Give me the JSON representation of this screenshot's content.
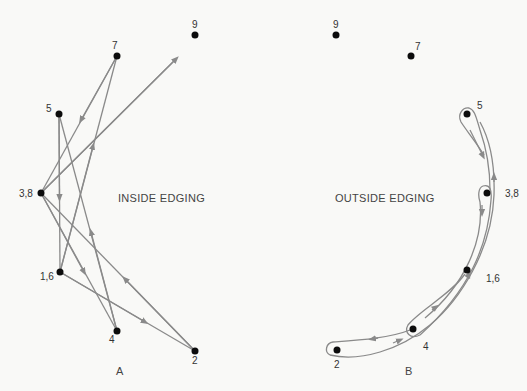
{
  "diagram_a": {
    "title": "INSIDE EDGING",
    "caption": "A",
    "points": [
      {
        "label": "9",
        "x": 195,
        "y": 35
      },
      {
        "label": "7",
        "x": 117,
        "y": 56
      },
      {
        "label": "5",
        "x": 59,
        "y": 114
      },
      {
        "label": "3,8",
        "x": 41,
        "y": 193
      },
      {
        "label": "1,6",
        "x": 60,
        "y": 272
      },
      {
        "label": "4",
        "x": 117,
        "y": 331
      },
      {
        "label": "2",
        "x": 195,
        "y": 351
      }
    ]
  },
  "diagram_b": {
    "title": "OUTSIDE EDGING",
    "caption": "B",
    "points": [
      {
        "label": "9",
        "x": 336,
        "y": 35
      },
      {
        "label": "7",
        "x": 411,
        "y": 56
      },
      {
        "label": "5",
        "x": 467,
        "y": 114
      },
      {
        "label": "3,8",
        "x": 487,
        "y": 193
      },
      {
        "label": "1,6",
        "x": 467,
        "y": 270
      },
      {
        "label": "4",
        "x": 413,
        "y": 329
      },
      {
        "label": "2",
        "x": 337,
        "y": 350
      }
    ]
  }
}
